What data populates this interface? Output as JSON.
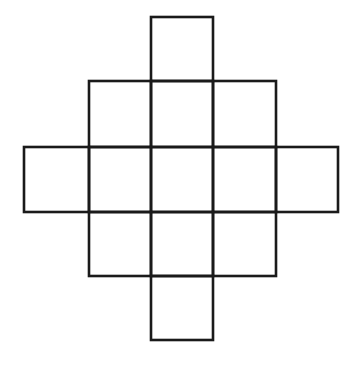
{
  "diagram": {
    "type": "grid-figure",
    "shape": "diamond-of-squares",
    "stroke_color": "#1a1a1a",
    "background_color": "#ffffff",
    "column_lines_x": [
      24,
      89,
      151,
      213,
      276,
      338
    ],
    "row_lines_y": [
      17,
      81,
      147,
      212,
      276,
      340
    ],
    "rows": [
      {
        "row": 0,
        "columns": [
          2
        ]
      },
      {
        "row": 1,
        "columns": [
          1,
          2,
          3
        ]
      },
      {
        "row": 2,
        "columns": [
          0,
          1,
          2,
          3,
          4
        ]
      },
      {
        "row": 3,
        "columns": [
          1,
          2,
          3
        ]
      },
      {
        "row": 4,
        "columns": [
          2
        ]
      }
    ],
    "square_count": 13
  }
}
